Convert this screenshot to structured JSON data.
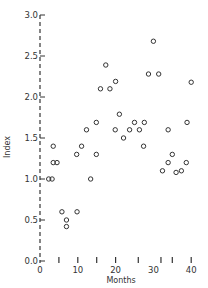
{
  "chart_data": {
    "type": "scatter",
    "title": "",
    "xlabel": "Months",
    "ylabel": "Index",
    "xlim": [
      0,
      40
    ],
    "ylim": [
      0.0,
      3.0
    ],
    "grid": false,
    "legend": null,
    "x_tick_labels": [
      "0",
      "10",
      "20",
      "30",
      "40"
    ],
    "x_tick_values": [
      0,
      10,
      20,
      30,
      40
    ],
    "x_minor_ticks": [
      5,
      10,
      15,
      20,
      26,
      32,
      35,
      40
    ],
    "y_tick_labels": [
      "0.0",
      "0.5",
      "1.0",
      "1.5",
      "2.0",
      "2.5",
      "3.0"
    ],
    "y_tick_values": [
      0.0,
      0.5,
      1.0,
      1.5,
      2.0,
      2.5,
      3.0
    ],
    "marker": "open-circle",
    "points": [
      {
        "x": 2.3,
        "y": 1.0
      },
      {
        "x": 3.2,
        "y": 1.0
      },
      {
        "x": 3.5,
        "y": 1.2
      },
      {
        "x": 4.5,
        "y": 1.2
      },
      {
        "x": 3.5,
        "y": 1.4
      },
      {
        "x": 5.8,
        "y": 0.6
      },
      {
        "x": 7.0,
        "y": 0.5
      },
      {
        "x": 7.0,
        "y": 0.42
      },
      {
        "x": 9.8,
        "y": 0.6
      },
      {
        "x": 9.7,
        "y": 1.3
      },
      {
        "x": 11.0,
        "y": 1.4
      },
      {
        "x": 12.3,
        "y": 1.6
      },
      {
        "x": 13.4,
        "y": 1.0
      },
      {
        "x": 14.9,
        "y": 1.3
      },
      {
        "x": 14.9,
        "y": 1.69
      },
      {
        "x": 16.0,
        "y": 2.1
      },
      {
        "x": 17.4,
        "y": 2.39
      },
      {
        "x": 18.5,
        "y": 2.1
      },
      {
        "x": 20.0,
        "y": 2.19
      },
      {
        "x": 19.9,
        "y": 1.6
      },
      {
        "x": 21.0,
        "y": 1.79
      },
      {
        "x": 22.1,
        "y": 1.5
      },
      {
        "x": 23.7,
        "y": 1.6
      },
      {
        "x": 25.0,
        "y": 1.69
      },
      {
        "x": 26.3,
        "y": 1.6
      },
      {
        "x": 27.4,
        "y": 1.4
      },
      {
        "x": 27.6,
        "y": 1.69
      },
      {
        "x": 28.7,
        "y": 2.28
      },
      {
        "x": 30.0,
        "y": 2.68
      },
      {
        "x": 31.4,
        "y": 2.28
      },
      {
        "x": 32.4,
        "y": 1.1
      },
      {
        "x": 33.9,
        "y": 1.2
      },
      {
        "x": 33.9,
        "y": 1.6
      },
      {
        "x": 35.0,
        "y": 1.3
      },
      {
        "x": 36.0,
        "y": 1.08
      },
      {
        "x": 37.4,
        "y": 1.1
      },
      {
        "x": 38.7,
        "y": 1.2
      },
      {
        "x": 38.9,
        "y": 1.69
      },
      {
        "x": 40.0,
        "y": 2.18
      }
    ]
  },
  "colors": {
    "ink": "#333333",
    "background": "#ffffff"
  }
}
